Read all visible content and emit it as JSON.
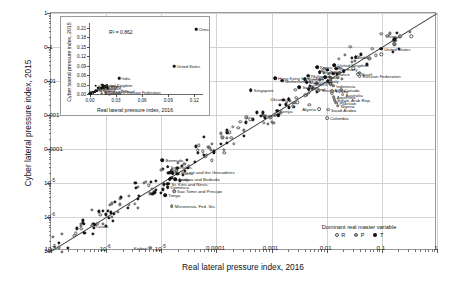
{
  "chart_data": {
    "type": "scatter",
    "title": "",
    "xlabel": "Real lateral pressure index, 2016",
    "ylabel": "Cyber lateral pressure index, 2015",
    "xscale": "log",
    "yscale": "log",
    "xlim": [
      1e-07,
      1
    ],
    "ylim": [
      1e-07,
      1
    ],
    "grid": true,
    "xticklabels": [
      "10⁻⁷",
      "10⁻⁶",
      "10⁻⁵",
      "0.0001",
      "0.001",
      "0.01",
      "0.1",
      "1"
    ],
    "yticklabels": [
      "10⁻⁷",
      "10⁻⁶",
      "10⁻⁵",
      "0.0001",
      "0.001",
      "0.01",
      "0.1",
      "1"
    ],
    "reference_line": "1:1 diagonal",
    "legend": {
      "title": "Dominant real master variable",
      "position": "lower-right",
      "entries": [
        {
          "key": "R",
          "label": "R",
          "marker": "open-circle",
          "color": "#ffffff"
        },
        {
          "key": "P",
          "label": "P",
          "marker": "gray-circle",
          "color": "#9a9a9a"
        },
        {
          "key": "T",
          "label": "T",
          "marker": "filled-circle",
          "color": "#111111"
        }
      ]
    },
    "labeled_points": [
      {
        "name": "China",
        "x": 0.215,
        "y": 0.205,
        "g": "P",
        "side": "l"
      },
      {
        "name": "United States",
        "x": 0.097,
        "y": 0.088,
        "g": "T",
        "side": "r"
      },
      {
        "name": "India",
        "x": 0.0335,
        "y": 0.0495,
        "g": "T",
        "side": "r"
      },
      {
        "name": "United Kingdom",
        "x": 0.0138,
        "y": 0.029,
        "g": "T",
        "side": "r"
      },
      {
        "name": "Germany",
        "x": 0.015,
        "y": 0.023,
        "g": "T",
        "side": "r"
      },
      {
        "name": "Japan",
        "x": 0.0205,
        "y": 0.0192,
        "g": "T",
        "side": "l"
      },
      {
        "name": "France",
        "x": 0.013,
        "y": 0.0162,
        "g": "T",
        "side": "r"
      },
      {
        "name": "Korea, Rep.",
        "x": 0.0067,
        "y": 0.0258,
        "g": "T",
        "side": "r"
      },
      {
        "name": "Thailand",
        "x": 0.0074,
        "y": 0.0185,
        "g": "T",
        "side": "r"
      },
      {
        "name": "Philippines",
        "x": 0.0046,
        "y": 0.0142,
        "g": "T",
        "side": "r"
      },
      {
        "name": "Spain",
        "x": 0.0093,
        "y": 0.0128,
        "g": "T",
        "side": "r"
      },
      {
        "name": "Vietnam",
        "x": 0.004,
        "y": 0.0112,
        "g": "T",
        "side": "r"
      },
      {
        "name": "Malaysia",
        "x": 0.0043,
        "y": 0.0093,
        "g": "T",
        "side": "r"
      },
      {
        "name": "Italy",
        "x": 0.0104,
        "y": 0.01,
        "g": "T",
        "side": "r"
      },
      {
        "name": "Hong Kong SAR, China",
        "x": 0.00115,
        "y": 0.0123,
        "g": "T",
        "side": "r"
      },
      {
        "name": "Netherlands",
        "x": 0.00155,
        "y": 0.0101,
        "g": "T",
        "side": "r"
      },
      {
        "name": "Mexico",
        "x": 0.0118,
        "y": 0.0082,
        "g": "P",
        "side": "l"
      },
      {
        "name": "Indonesia",
        "x": 0.0131,
        "y": 0.0072,
        "g": "P",
        "side": "r"
      },
      {
        "name": "Brazil",
        "x": 0.0372,
        "y": 0.016,
        "g": "R",
        "side": "r"
      },
      {
        "name": "Russian Federation",
        "x": 0.0395,
        "y": 0.0137,
        "g": "R",
        "side": "r"
      },
      {
        "name": "Sweden",
        "x": 0.0032,
        "y": 0.0066,
        "g": "T",
        "side": "r"
      },
      {
        "name": "Poland",
        "x": 0.0047,
        "y": 0.0057,
        "g": "T",
        "side": "r"
      },
      {
        "name": "South Africa",
        "x": 0.0072,
        "y": 0.0053,
        "g": "P",
        "side": "r"
      },
      {
        "name": "Turkey",
        "x": 0.0125,
        "y": 0.005,
        "g": "P",
        "side": "r"
      },
      {
        "name": "Canada",
        "x": 0.0183,
        "y": 0.0056,
        "g": "P",
        "side": "r"
      },
      {
        "name": "Australia",
        "x": 0.0194,
        "y": 0.004,
        "g": "R",
        "side": "r"
      },
      {
        "name": "Argentina",
        "x": 0.0134,
        "y": 0.0033,
        "g": "P",
        "side": "r"
      },
      {
        "name": "Egypt, Arab Rep.",
        "x": 0.0139,
        "y": 0.0027,
        "g": "P",
        "side": "r"
      },
      {
        "name": "Pakistan",
        "x": 0.015,
        "y": 0.0023,
        "g": "P",
        "side": "r"
      },
      {
        "name": "Nigeria",
        "x": 0.0158,
        "y": 0.0019,
        "g": "P",
        "side": "r"
      },
      {
        "name": "Saudi Arabia",
        "x": 0.0106,
        "y": 0.00145,
        "g": "R",
        "side": "r"
      },
      {
        "name": "Algeria",
        "x": 0.0072,
        "y": 0.0015,
        "g": "R",
        "side": "l"
      },
      {
        "name": "Colombia",
        "x": 0.0101,
        "y": 0.00082,
        "g": "R",
        "side": "r"
      },
      {
        "name": "Singapore",
        "x": 0.00042,
        "y": 0.0054,
        "g": "T",
        "side": "r"
      },
      {
        "name": "Ukraine",
        "x": 0.00205,
        "y": 0.00295,
        "g": "T",
        "side": "l"
      },
      {
        "name": "Kenya",
        "x": 0.00125,
        "y": 0.00132,
        "g": "T",
        "side": "r"
      },
      {
        "name": "Ghana",
        "x": 0.00133,
        "y": 0.00097,
        "g": "T",
        "side": "l"
      },
      {
        "name": "Bermuda",
        "x": 1.05e-05,
        "y": 4.6e-05,
        "g": "T",
        "side": "r"
      },
      {
        "name": "Seychelles",
        "x": 1.3e-05,
        "y": 3e-05,
        "g": "T",
        "side": "r"
      },
      {
        "name": "St. Vincent and the Grenadines",
        "x": 1.48e-05,
        "y": 2.1e-05,
        "g": "T",
        "side": "r"
      },
      {
        "name": "St. Lucia",
        "x": 1.62e-05,
        "y": 1.95e-05,
        "g": "T",
        "side": "r"
      },
      {
        "name": "Grenada",
        "x": 1.42e-05,
        "y": 1.3e-05,
        "g": "T",
        "side": "r"
      },
      {
        "name": "Antigua and Barbuda",
        "x": 1.8e-05,
        "y": 1.28e-05,
        "g": "T",
        "side": "r"
      },
      {
        "name": "St. Kitts and Nevis",
        "x": 1.35e-05,
        "y": 9.5e-06,
        "g": "T",
        "side": "r"
      },
      {
        "name": "Dominica",
        "x": 1.3e-05,
        "y": 7.4e-06,
        "g": "T",
        "side": "r"
      },
      {
        "name": "Sao Tome and Principe",
        "x": 1.7e-05,
        "y": 5.8e-06,
        "g": "P",
        "side": "r"
      },
      {
        "name": "Tonga",
        "x": 1.18e-05,
        "y": 4.3e-06,
        "g": "T",
        "side": "r"
      },
      {
        "name": "Micronesia, Fed. Sts.",
        "x": 1.55e-05,
        "y": 2.1e-06,
        "g": "P",
        "side": "r"
      },
      {
        "name": "Tuvalu",
        "x": 5.6e-07,
        "y": 5.6e-07,
        "g": "P",
        "side": "r"
      },
      {
        "name": "Kiribati",
        "x": 6.3e-06,
        "y": 1.25e-07,
        "g": "P",
        "side": "l"
      }
    ],
    "inset": {
      "type": "scatter",
      "xlabel": "Real lateral pressure index, 2016",
      "ylabel": "Cyber lateral pressure index, 2015",
      "xscale": "linear",
      "yscale": "linear",
      "xlim": [
        0,
        0.13
      ],
      "ylim": [
        0,
        0.225
      ],
      "xticklabels": [
        "0.00",
        "0.03",
        "0.06",
        "0.09",
        "0.12"
      ],
      "xtickvalues": [
        0,
        0.03,
        0.06,
        0.09,
        0.12
      ],
      "yticklabels": [
        "0.00",
        "0.03",
        "0.06",
        "0.09",
        "0.12",
        "0.15",
        "0.18",
        "0.21"
      ],
      "ytickvalues": [
        0,
        0.03,
        0.06,
        0.09,
        0.12,
        0.15,
        0.18,
        0.21
      ],
      "annotation": "R² = 0.862",
      "r_squared": 0.862,
      "labeled_points": [
        {
          "name": "China",
          "x": 0.122,
          "y": 0.205,
          "g": "T",
          "side": "r"
        },
        {
          "name": "United States",
          "x": 0.097,
          "y": 0.088,
          "g": "T",
          "side": "r"
        },
        {
          "name": "India",
          "x": 0.0335,
          "y": 0.0495,
          "g": "T",
          "side": "r"
        },
        {
          "name": "United Kingdom",
          "x": 0.0138,
          "y": 0.029,
          "g": "T",
          "side": "r"
        },
        {
          "name": "Germany",
          "x": 0.015,
          "y": 0.0255,
          "g": "T",
          "side": "r"
        },
        {
          "name": "Korea, Rep.",
          "x": 0.0067,
          "y": 0.0258,
          "g": "T",
          "side": "r"
        },
        {
          "name": "Japan",
          "x": 0.0205,
          "y": 0.0192,
          "g": "T",
          "side": "r"
        },
        {
          "name": "Spain",
          "x": 0.0093,
          "y": 0.0205,
          "g": "T",
          "side": "r"
        },
        {
          "name": "France",
          "x": 0.013,
          "y": 0.018,
          "g": "T",
          "side": "r"
        },
        {
          "name": "Mexico",
          "x": 0.0118,
          "y": 0.0112,
          "g": "P",
          "side": "r"
        },
        {
          "name": "Indonesia",
          "x": 0.0131,
          "y": 0.0108,
          "g": "P",
          "side": "r"
        },
        {
          "name": "Brazil",
          "x": 0.0372,
          "y": 0.0082,
          "g": "R",
          "side": "r"
        },
        {
          "name": "Russian Federation",
          "x": 0.0395,
          "y": 0.0062,
          "g": "R",
          "side": "r"
        },
        {
          "name": "Canada",
          "x": 0.0183,
          "y": 0.0056,
          "g": "P",
          "side": "r"
        },
        {
          "name": "Argentina",
          "x": 0.0134,
          "y": 0.0033,
          "g": "P",
          "side": "r"
        }
      ]
    }
  }
}
